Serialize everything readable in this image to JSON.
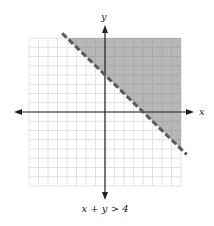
{
  "chart_data": {
    "type": "line",
    "title": "",
    "caption": "x + y > 4",
    "xlabel": "x",
    "ylabel": "y",
    "xlim": [
      -8,
      8
    ],
    "ylim": [
      -8,
      8
    ],
    "grid": true,
    "grid_step": 1,
    "boundary": {
      "equation": "x + y = 4",
      "style": "dashed",
      "x_intercept": 4,
      "y_intercept": 4,
      "points": [
        [
          -4.5,
          8.5
        ],
        [
          8.6,
          -4.6
        ]
      ]
    },
    "shaded_region": {
      "inequality": "x + y > 4",
      "side": "above-right",
      "vertices": [
        [
          -4,
          8
        ],
        [
          8,
          8
        ],
        [
          8,
          -4
        ]
      ]
    }
  },
  "colors": {
    "grid": "#e2e2e2",
    "shade": "#b7b7b7",
    "shade_grid": "#a9a9a9",
    "axis": "#222222",
    "boundary": "#5a5a5a"
  },
  "labels": {
    "x_axis": "x",
    "y_axis": "y",
    "caption": "x + y > 4"
  }
}
